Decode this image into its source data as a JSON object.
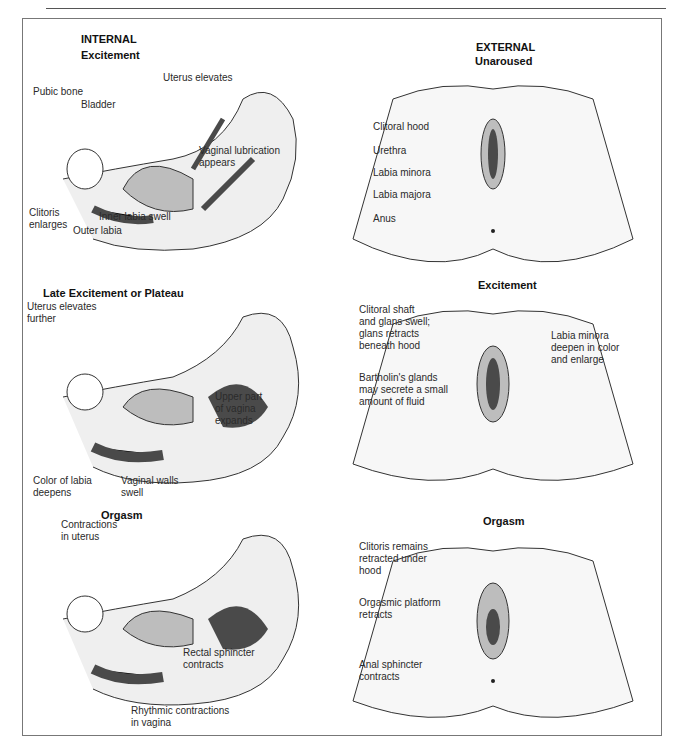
{
  "figure": {
    "columns": {
      "internal": {
        "label": "INTERNAL",
        "view": "sagittal cross-section"
      },
      "external": {
        "label": "EXTERNAL",
        "view": "external anatomy"
      }
    },
    "internal_panels": [
      {
        "stage": "Excitement",
        "labels": [
          {
            "text": "Uterus elevates"
          },
          {
            "text": "Pubic bone"
          },
          {
            "text": "Bladder"
          },
          {
            "text": "Vaginal lubrication\nappears"
          },
          {
            "text": "Clitoris\nenlarges"
          },
          {
            "text": "Inner labia swell"
          },
          {
            "text": "Outer labia"
          }
        ]
      },
      {
        "stage": "Late Excitement or Plateau",
        "labels": [
          {
            "text": "Uterus elevates\nfurther"
          },
          {
            "text": "Upper part\nof vagina\nexpands"
          },
          {
            "text": "Color of labia\ndeepens"
          },
          {
            "text": "Vaginal walls\nswell"
          }
        ]
      },
      {
        "stage": "Orgasm",
        "labels": [
          {
            "text": "Contractions\nin uterus"
          },
          {
            "text": "Rectal sphincter\ncontracts"
          },
          {
            "text": "Rhythmic contractions\nin vagina"
          }
        ]
      }
    ],
    "external_panels": [
      {
        "stage": "Unaroused",
        "labels": [
          {
            "text": "Clitoral hood"
          },
          {
            "text": "Urethra"
          },
          {
            "text": "Labia minora"
          },
          {
            "text": "Labia majora"
          },
          {
            "text": "Anus"
          }
        ]
      },
      {
        "stage": "Excitement",
        "labels": [
          {
            "text": "Clitoral shaft\nand glans swell;\nglans retracts\nbeneath hood"
          },
          {
            "text": "Bartholin's glands\nmay secrete a small\namount of fluid"
          },
          {
            "text": "Labia minora\ndeepen in color\nand enlarge"
          }
        ]
      },
      {
        "stage": "Orgasm",
        "labels": [
          {
            "text": "Clitoris remains\nretracted under\nhood"
          },
          {
            "text": "Orgasmic platform\nretracts"
          },
          {
            "text": "Anal sphincter\ncontracts"
          }
        ]
      }
    ]
  },
  "colors": {
    "line": "#333333",
    "fill_light": "#efefef",
    "fill_mid": "#bdbdbd",
    "fill_dark": "#4a4a4a",
    "frame": "#777777"
  }
}
